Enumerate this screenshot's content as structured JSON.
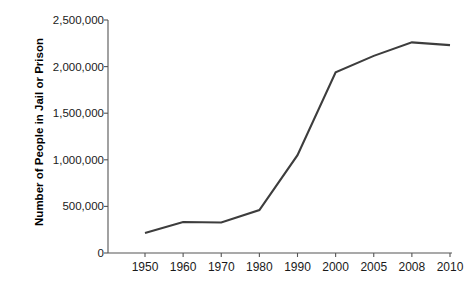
{
  "chart_data": {
    "type": "line",
    "title": "",
    "xlabel": "",
    "ylabel": "Number of People in Jail or Prison",
    "categories": [
      "1950",
      "1960",
      "1970",
      "1980",
      "1990",
      "2000",
      "2005",
      "2008",
      "2010"
    ],
    "values": [
      215000,
      333000,
      328000,
      461000,
      1050000,
      1940000,
      2115000,
      2260000,
      2230000
    ],
    "series": [
      {
        "name": "Number of People in Jail or Prison",
        "values": [
          215000,
          333000,
          328000,
          461000,
          1050000,
          1940000,
          2115000,
          2260000,
          2230000
        ]
      }
    ],
    "ylim": [
      0,
      2500000
    ],
    "ytick_values": [
      0,
      500000,
      1000000,
      1500000,
      2000000,
      2500000
    ],
    "ytick_labels": [
      "0",
      "500,000",
      "1,000,000",
      "1,500,000",
      "2,000,000",
      "2,500,000"
    ],
    "xtick_labels": [
      "1950",
      "1960",
      "1970",
      "1980",
      "1990",
      "2000",
      "2005",
      "2008",
      "2010"
    ],
    "grid": false,
    "legend": "none",
    "line_color": "#3d3d3d",
    "axis_color": "#555555",
    "background_color": "#ffffff"
  }
}
